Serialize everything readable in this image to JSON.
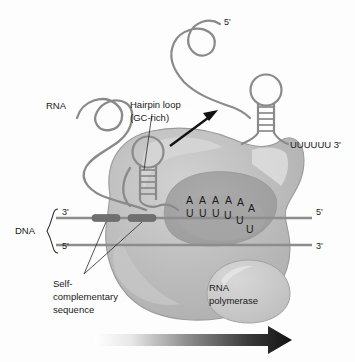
{
  "figure": {
    "title_alt": "Rho-independent transcription termination",
    "background_color": "#fdfdfd"
  },
  "labels": {
    "rna": "RNA",
    "hairpin_loop_line1": "Hairpin loop",
    "hairpin_loop_line2": "(GC-rich)",
    "dna": "DNA",
    "dna_top_end": "3'",
    "dna_bottom_end": "5'",
    "dna_top_right_end": "5'",
    "dna_bottom_right_end": "3'",
    "rna_five_prime": "5'",
    "released_tail": "UUUUUU 3'",
    "self_comp_line1": "Self-",
    "self_comp_line2": "complementary",
    "self_comp_line3": "sequence",
    "polymerase_line1": "RNA",
    "polymerase_line2": "polymerase"
  },
  "base_pairing": {
    "top_row_label": "A",
    "bottom_row_label": "U",
    "top_row": [
      "A",
      "A",
      "A",
      "A",
      "A",
      "A"
    ],
    "bottom_row": [
      "U",
      "U",
      "U",
      "U",
      "U",
      "U"
    ],
    "top_positions": [
      {
        "x": 190,
        "y": 200
      },
      {
        "x": 203,
        "y": 200
      },
      {
        "x": 216,
        "y": 200
      },
      {
        "x": 229,
        "y": 200
      },
      {
        "x": 241,
        "y": 202
      },
      {
        "x": 252,
        "y": 208
      }
    ],
    "bottom_positions": [
      {
        "x": 190,
        "y": 213
      },
      {
        "x": 203,
        "y": 213
      },
      {
        "x": 216,
        "y": 213
      },
      {
        "x": 228,
        "y": 215
      },
      {
        "x": 240,
        "y": 220
      },
      {
        "x": 250,
        "y": 229
      }
    ]
  },
  "colors": {
    "rna_strand": "#8a8a8a",
    "dna_strand": "#8d8d8d",
    "self_complementary": "#6f6f6f",
    "polymerase_body": "#b9b9b9",
    "polymerase_body_light": "#cccccc",
    "polymerase_cleft": "#a0a0a0",
    "polymerase_lobe": "#c4c4c4",
    "highlight": "#e2e2e2",
    "outline": "#8f8f8f",
    "text": "#1a1a1a",
    "arrow_black": "#111111"
  },
  "arrows": {
    "release_arrow": "diagonal-up-right",
    "direction_arrow": "gradient-right"
  }
}
